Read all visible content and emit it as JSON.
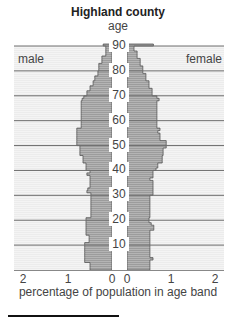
{
  "chart_data": {
    "type": "bar",
    "subtype": "population-pyramid",
    "title": "Highland county",
    "ylabel": "age",
    "xlabel": "percentage of population in age band",
    "left_label": "male",
    "right_label": "female",
    "y_ticks": [
      10,
      20,
      30,
      40,
      50,
      60,
      70,
      80,
      90
    ],
    "x_ticks_left": [
      "2",
      "1",
      "0"
    ],
    "x_ticks_right": [
      "0",
      "1",
      "2"
    ],
    "xlim": [
      0,
      2
    ],
    "ylim": [
      0,
      90
    ],
    "grid": "horizontal every 10 years",
    "ages": [
      0,
      1,
      2,
      3,
      4,
      5,
      6,
      7,
      8,
      9,
      10,
      11,
      12,
      13,
      14,
      15,
      16,
      17,
      18,
      19,
      20,
      21,
      22,
      23,
      24,
      25,
      26,
      27,
      28,
      29,
      30,
      31,
      32,
      33,
      34,
      35,
      36,
      37,
      38,
      39,
      40,
      41,
      42,
      43,
      44,
      45,
      46,
      47,
      48,
      49,
      50,
      51,
      52,
      53,
      54,
      55,
      56,
      57,
      58,
      59,
      60,
      61,
      62,
      63,
      64,
      65,
      66,
      67,
      68,
      69,
      70,
      71,
      72,
      73,
      74,
      75,
      76,
      77,
      78,
      79,
      80,
      81,
      82,
      83,
      84,
      85,
      86,
      87,
      88,
      89,
      90
    ],
    "series": [
      {
        "name": "male",
        "values": [
          0.5,
          0.5,
          0.5,
          0.62,
          0.62,
          0.62,
          0.62,
          0.62,
          0.62,
          0.62,
          0.62,
          0.52,
          0.52,
          0.52,
          0.59,
          0.59,
          0.59,
          0.59,
          0.59,
          0.59,
          0.59,
          0.48,
          0.48,
          0.48,
          0.48,
          0.48,
          0.48,
          0.48,
          0.48,
          0.48,
          0.48,
          0.57,
          0.55,
          0.5,
          0.5,
          0.5,
          0.5,
          0.5,
          0.57,
          0.5,
          0.59,
          0.59,
          0.59,
          0.66,
          0.66,
          0.66,
          0.73,
          0.73,
          0.73,
          0.73,
          0.8,
          0.8,
          0.8,
          0.8,
          0.8,
          0.8,
          0.8,
          0.7,
          0.7,
          0.7,
          0.7,
          0.7,
          0.7,
          0.7,
          0.7,
          0.7,
          0.7,
          0.7,
          0.68,
          0.64,
          0.57,
          0.57,
          0.5,
          0.5,
          0.43,
          0.43,
          0.39,
          0.39,
          0.32,
          0.32,
          0.3,
          0.3,
          0.3,
          0.23,
          0.23,
          0.23,
          0.14,
          0.14,
          0.14,
          0.14,
          0.2
        ]
      },
      {
        "name": "female",
        "values": [
          0.52,
          0.52,
          0.52,
          0.52,
          0.59,
          0.52,
          0.52,
          0.52,
          0.52,
          0.52,
          0.52,
          0.52,
          0.52,
          0.52,
          0.52,
          0.52,
          0.61,
          0.61,
          0.55,
          0.5,
          0.5,
          0.52,
          0.52,
          0.52,
          0.52,
          0.52,
          0.52,
          0.52,
          0.52,
          0.52,
          0.59,
          0.59,
          0.59,
          0.59,
          0.59,
          0.59,
          0.52,
          0.59,
          0.59,
          0.59,
          0.66,
          0.7,
          0.7,
          0.8,
          0.8,
          0.8,
          0.82,
          0.82,
          0.82,
          0.89,
          0.89,
          0.89,
          0.75,
          0.75,
          0.75,
          0.7,
          0.75,
          0.68,
          0.68,
          0.68,
          0.68,
          0.68,
          0.68,
          0.68,
          0.68,
          0.68,
          0.68,
          0.68,
          0.73,
          0.68,
          0.57,
          0.57,
          0.57,
          0.5,
          0.5,
          0.5,
          0.43,
          0.43,
          0.43,
          0.36,
          0.36,
          0.36,
          0.3,
          0.3,
          0.3,
          0.23,
          0.23,
          0.23,
          0.16,
          0.16,
          0.6
        ]
      }
    ]
  }
}
